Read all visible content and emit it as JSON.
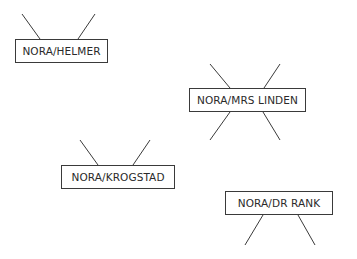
{
  "diagram": {
    "type": "relationship-nodes",
    "nodes": [
      {
        "id": "helmer",
        "label": "NORA/HELMER",
        "box": [
          15,
          39,
          93,
          24
        ]
      },
      {
        "id": "linden",
        "label": "NORA/MRS LINDEN",
        "box": [
          189,
          88,
          117,
          24
        ]
      },
      {
        "id": "krogstad",
        "label": "NORA/KROGSTAD",
        "box": [
          61,
          165,
          114,
          24
        ]
      },
      {
        "id": "rank",
        "label": "NORA/DR RANK",
        "box": [
          225,
          191,
          108,
          24
        ]
      }
    ],
    "connectors": [
      {
        "node": "helmer",
        "side": "top",
        "from": [
          22,
          14
        ],
        "to": [
          40,
          39
        ]
      },
      {
        "node": "helmer",
        "side": "top",
        "from": [
          95,
          14
        ],
        "to": [
          78,
          39
        ]
      },
      {
        "node": "linden",
        "side": "top",
        "from": [
          210,
          64
        ],
        "to": [
          230,
          88
        ]
      },
      {
        "node": "linden",
        "side": "top",
        "from": [
          280,
          64
        ],
        "to": [
          264,
          88
        ]
      },
      {
        "node": "linden",
        "side": "bottom",
        "from": [
          230,
          112
        ],
        "to": [
          210,
          140
        ]
      },
      {
        "node": "linden",
        "side": "bottom",
        "from": [
          263,
          112
        ],
        "to": [
          280,
          140
        ]
      },
      {
        "node": "krogstad",
        "side": "top",
        "from": [
          80,
          140
        ],
        "to": [
          98,
          165
        ]
      },
      {
        "node": "krogstad",
        "side": "top",
        "from": [
          150,
          140
        ],
        "to": [
          133,
          165
        ]
      },
      {
        "node": "rank",
        "side": "bottom",
        "from": [
          263,
          215
        ],
        "to": [
          245,
          245
        ]
      },
      {
        "node": "rank",
        "side": "bottom",
        "from": [
          298,
          215
        ],
        "to": [
          315,
          245
        ]
      }
    ],
    "colors": {
      "line": "#3a3a3a",
      "text": "#2a2a2a",
      "background": "#ffffff"
    }
  }
}
